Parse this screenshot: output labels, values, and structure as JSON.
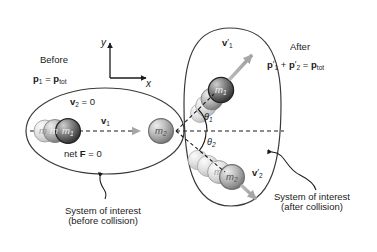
{
  "figure": {
    "type": "physics-collision-diagram",
    "title_before": "Before",
    "title_after": "After",
    "axes": {
      "x_label": "x",
      "y_label": "y"
    },
    "before": {
      "momentum_eq": {
        "p": "p",
        "sub1": "1",
        "eq": "=",
        "p2": "p",
        "tot": "tot"
      },
      "v2_label": {
        "v": "v",
        "sub": "2",
        "eq": "= 0"
      },
      "v1_label": {
        "v": "v",
        "sub": "1"
      },
      "net_force": {
        "pre": "net ",
        "f": "F",
        "eq": " = 0"
      },
      "ball_m1": {
        "m": "m",
        "sub": "1"
      },
      "ball_m2": {
        "m": "m",
        "sub": "2"
      },
      "caption_line1": "System of interest",
      "caption_line2": "(before collision)"
    },
    "after": {
      "momentum_eq": {
        "p1": "p",
        "p1_prime": "′",
        "p1_sub": "1",
        "plus": "+",
        "p2": "p",
        "p2_prime": "′",
        "p2_sub": "2",
        "eq": "=",
        "ptot": "p",
        "tot": "tot"
      },
      "v1_prime_label": {
        "v": "v",
        "prime": "′",
        "sub": "1"
      },
      "v2_prime_label": {
        "v": "v",
        "prime": "′",
        "sub": "2"
      },
      "theta1": {
        "sym": "θ",
        "sub": "1"
      },
      "theta2": {
        "sym": "θ",
        "sub": "2"
      },
      "ball_m1": {
        "m": "m",
        "sub": "1"
      },
      "ball_m2": {
        "m": "m",
        "sub": "2"
      },
      "caption_line1": "System of interest",
      "caption_line2": "(after collision)"
    },
    "colors": {
      "background": "#ffffff",
      "ink": "#1b1b1b",
      "ball_dark": "#4a4a4a",
      "ball_light": "#d9d9d9",
      "arrow_gray": "#a8a8a8",
      "outline": "#2b2b2b"
    }
  }
}
